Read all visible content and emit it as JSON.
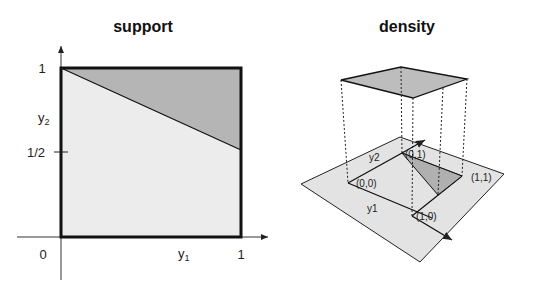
{
  "panels": {
    "left": {
      "title": "support",
      "x_label": "y",
      "x_label_sub": "1",
      "y_label": "y",
      "y_label_sub": "2",
      "origin_label": "0",
      "x_tick_label": "1",
      "y_tick_top_label": "1",
      "y_tick_half_label": "1/2"
    },
    "right": {
      "title": "density",
      "axis_y1_label": "y1",
      "axis_y2_label": "y2",
      "corner_00": "(0,0)",
      "corner_01": "(0,1)",
      "corner_11": "(1,1)",
      "corner_10": "(1,0)"
    }
  },
  "colors": {
    "light_fill": "#ececec",
    "dark_fill": "#b5b5b5",
    "plane_fill": "#e3e3e3",
    "top_fill": "#bdbdbd",
    "stroke": "#111111"
  }
}
